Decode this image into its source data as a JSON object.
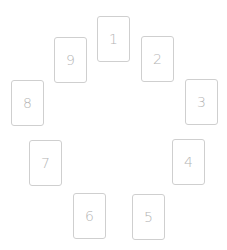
{
  "spread": {
    "cards": [
      {
        "label": "1",
        "x": 97,
        "y": 16
      },
      {
        "label": "2",
        "x": 141,
        "y": 36
      },
      {
        "label": "3",
        "x": 185,
        "y": 79
      },
      {
        "label": "4",
        "x": 172,
        "y": 139
      },
      {
        "label": "5",
        "x": 132,
        "y": 194
      },
      {
        "label": "6",
        "x": 73,
        "y": 193
      },
      {
        "label": "7",
        "x": 29,
        "y": 140
      },
      {
        "label": "8",
        "x": 11,
        "y": 80
      },
      {
        "label": "9",
        "x": 54,
        "y": 37
      }
    ]
  },
  "colors": {
    "card_border": "#cfcfcf",
    "card_number": "#b4b4b4",
    "background": "#ffffff"
  }
}
